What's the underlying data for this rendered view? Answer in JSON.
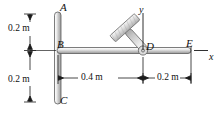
{
  "figure": {
    "type": "engineering-mechanics-diagram",
    "background_color": "#ffffff",
    "member_fill_light": "#e8e8e8",
    "member_fill_mid": "#c9c9c9",
    "member_stroke": "#4a4a4a",
    "dimension_color": "#1a1a1a"
  },
  "points": {
    "A": "A",
    "B": "B",
    "C": "C",
    "D": "D",
    "E": "E"
  },
  "axes": {
    "x_label": "x",
    "y_label": "y",
    "origin_point": "D"
  },
  "dimensions": {
    "vertical_top": "0.2 m",
    "vertical_bottom": "0.2 m",
    "horizontal_left": "0.4 m",
    "horizontal_right": "0.2 m"
  },
  "geometry": {
    "post_label_top": "A",
    "post_label_joint": "B",
    "post_label_bottom": "C",
    "pin_label": "D",
    "rod_end_label": "E",
    "tilted_member_angle_deg": 45
  }
}
